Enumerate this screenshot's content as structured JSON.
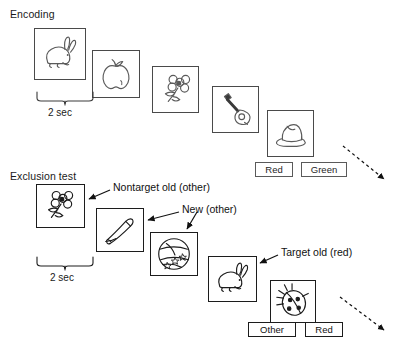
{
  "figure": {
    "width": 398,
    "height": 351,
    "background": "#ffffff",
    "line_color": "#1c1c1c",
    "card_border_color": "#4a4a4a"
  },
  "sections": {
    "encoding": {
      "label": "Encoding",
      "x": 10,
      "y": 8,
      "duration_label": "2 sec",
      "duration_x": 48,
      "duration_y": 107,
      "brace": {
        "x1": 37,
        "x2": 93,
        "y": 92,
        "depth": 11
      },
      "items": [
        {
          "name": "rabbit",
          "icon": "rabbit-icon",
          "x": 34,
          "y": 28,
          "w": 52,
          "h": 52
        },
        {
          "name": "apple",
          "icon": "apple-icon",
          "x": 92,
          "y": 50,
          "w": 48,
          "h": 48
        },
        {
          "name": "flower",
          "icon": "flower-icon",
          "x": 152,
          "y": 66,
          "w": 47,
          "h": 47
        },
        {
          "name": "guitar",
          "icon": "guitar-icon",
          "x": 212,
          "y": 86,
          "w": 47,
          "h": 47
        },
        {
          "name": "hat",
          "icon": "hat-icon",
          "x": 267,
          "y": 110,
          "w": 47,
          "h": 47
        }
      ],
      "buttons": [
        {
          "label": "Red",
          "x": 255,
          "y": 162,
          "w": 38,
          "h": 15
        },
        {
          "label": "Green",
          "x": 301,
          "y": 162,
          "w": 46,
          "h": 15
        }
      ],
      "continuation_arrow": {
        "x1": 343,
        "y1": 146,
        "x2": 386,
        "y2": 181
      }
    },
    "exclusion_test": {
      "label": "Exclusion test",
      "x": 10,
      "y": 170,
      "duration_label": "2 sec",
      "duration_x": 50,
      "duration_y": 272,
      "brace": {
        "x1": 37,
        "x2": 93,
        "y": 257,
        "depth": 11
      },
      "items": [
        {
          "name": "flower",
          "icon": "flower-icon",
          "x": 36,
          "y": 184,
          "w": 49,
          "h": 44
        },
        {
          "name": "pen",
          "icon": "pen-icon",
          "x": 96,
          "y": 208,
          "w": 48,
          "h": 44
        },
        {
          "name": "ball",
          "icon": "ball-icon",
          "x": 150,
          "y": 232,
          "w": 48,
          "h": 44
        },
        {
          "name": "rabbit",
          "icon": "rabbit-icon",
          "x": 208,
          "y": 256,
          "w": 49,
          "h": 46
        },
        {
          "name": "ladybug",
          "icon": "ladybug-icon",
          "x": 270,
          "y": 280,
          "w": 46,
          "h": 43
        }
      ],
      "buttons": [
        {
          "label": "Other",
          "x": 248,
          "y": 322,
          "w": 48,
          "h": 15
        },
        {
          "label": "Red",
          "x": 305,
          "y": 322,
          "w": 38,
          "h": 15
        }
      ],
      "annotations": [
        {
          "text": "Nontarget old (other)",
          "text_x": 113,
          "text_y": 181,
          "arrow": {
            "x1": 110,
            "y1": 190,
            "x2": 88,
            "y2": 199
          }
        },
        {
          "text": "New (other)",
          "text_x": 182,
          "text_y": 203,
          "arrow": {
            "x1": 179,
            "y1": 212,
            "x2": 147,
            "y2": 219
          }
        },
        {
          "text": "",
          "text_x": 0,
          "text_y": 0,
          "arrow": {
            "x1": 196,
            "y1": 212,
            "x2": 186,
            "y2": 229
          }
        },
        {
          "text": "Target old (red)",
          "text_x": 281,
          "text_y": 246,
          "arrow": {
            "x1": 278,
            "y1": 255,
            "x2": 259,
            "y2": 263
          }
        }
      ],
      "continuation_arrow": {
        "x1": 340,
        "y1": 297,
        "x2": 386,
        "y2": 332
      }
    }
  }
}
